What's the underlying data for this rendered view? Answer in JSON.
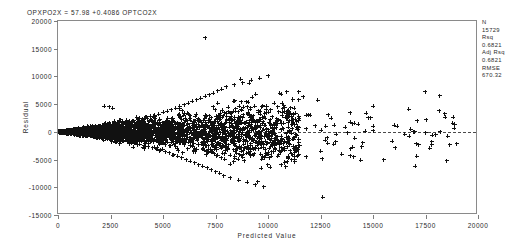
{
  "title": "OPXPO2X = 57.98 +0.4086 OPTCO2X",
  "axes": {
    "x_title": "Predicted Value",
    "y_title": "Residual"
  },
  "stats": {
    "n_label": "N",
    "n_value": "15729",
    "rsq_label": "Rsq",
    "rsq_value": "0.6821",
    "adj_rsq_label": "Adj Rsq",
    "adj_rsq_value": "0.6821",
    "rmse_label": "RMSE",
    "rmse_value": "670.32"
  },
  "chart_data": {
    "type": "scatter",
    "title": "OPXPO2X = 57.98 +0.4086 OPTCO2X",
    "xlabel": "Predicted Value",
    "ylabel": "Residual",
    "xlim": [
      0,
      20000
    ],
    "ylim": [
      -15000,
      20000
    ],
    "xticks": [
      0,
      2500,
      5000,
      7500,
      10000,
      12500,
      15000,
      17500,
      20000
    ],
    "yticks": [
      -15000,
      -10000,
      -5000,
      0,
      5000,
      10000,
      15000,
      20000
    ],
    "xtick_labels": [
      "0",
      "2500",
      "5000",
      "7500",
      "10000",
      "12500",
      "15000",
      "17500",
      "20000"
    ],
    "ytick_labels": [
      "-15000",
      "-10000",
      "-5000",
      "0",
      "5000",
      "10000",
      "15000",
      "20000"
    ],
    "grid": false,
    "legend_position": "outside-right",
    "marker": "plus",
    "marker_color": "#111111",
    "reference_lines": [
      {
        "orientation": "horizontal",
        "value": 0,
        "style": "dashed",
        "color": "#4a4a4a"
      }
    ],
    "annotations": [
      {
        "text": "N 15729"
      },
      {
        "text": "Rsq 0.6821"
      },
      {
        "text": "Adj Rsq 0.6821"
      },
      {
        "text": "RMSE 670.32"
      }
    ],
    "series": [
      {
        "name": "residuals",
        "points": [
          [
            60,
            20
          ],
          [
            90,
            -30
          ],
          [
            120,
            40
          ],
          [
            150,
            -50
          ],
          [
            180,
            60
          ],
          [
            210,
            -70
          ],
          [
            240,
            80
          ],
          [
            270,
            -90
          ],
          [
            300,
            100
          ],
          [
            330,
            -110
          ],
          [
            360,
            120
          ],
          [
            390,
            -130
          ],
          [
            420,
            140
          ],
          [
            450,
            -150
          ],
          [
            480,
            160
          ],
          [
            510,
            -170
          ],
          [
            540,
            180
          ],
          [
            570,
            -190
          ],
          [
            600,
            200
          ],
          [
            630,
            -210
          ],
          [
            660,
            220
          ],
          [
            690,
            -230
          ],
          [
            720,
            240
          ],
          [
            750,
            -250
          ],
          [
            780,
            260
          ],
          [
            810,
            -270
          ],
          [
            840,
            280
          ],
          [
            870,
            -290
          ],
          [
            900,
            300
          ],
          [
            930,
            -310
          ],
          [
            960,
            320
          ],
          [
            990,
            -330
          ],
          [
            1020,
            340
          ],
          [
            1050,
            -350
          ],
          [
            1080,
            360
          ],
          [
            1110,
            -380
          ],
          [
            1140,
            400
          ],
          [
            1170,
            -420
          ],
          [
            1200,
            440
          ],
          [
            1230,
            -460
          ],
          [
            1260,
            480
          ],
          [
            1290,
            -500
          ],
          [
            1320,
            520
          ],
          [
            1350,
            -540
          ],
          [
            1380,
            560
          ],
          [
            1410,
            -580
          ],
          [
            1440,
            600
          ],
          [
            1470,
            -620
          ],
          [
            1500,
            640
          ],
          [
            1530,
            -660
          ],
          [
            1560,
            680
          ],
          [
            1590,
            -700
          ],
          [
            1620,
            720
          ],
          [
            1650,
            -740
          ],
          [
            1680,
            760
          ],
          [
            1710,
            -780
          ],
          [
            1740,
            800
          ],
          [
            1770,
            -820
          ],
          [
            1800,
            840
          ],
          [
            1830,
            -860
          ],
          [
            1860,
            880
          ],
          [
            1890,
            -900
          ],
          [
            1920,
            920
          ],
          [
            1950,
            -940
          ],
          [
            1980,
            960
          ],
          [
            2010,
            -980
          ],
          [
            2040,
            1000
          ],
          [
            2070,
            -1020
          ],
          [
            2100,
            1040
          ],
          [
            2130,
            -1060
          ],
          [
            2160,
            1080
          ],
          [
            2190,
            -1100
          ],
          [
            2220,
            1120
          ],
          [
            2250,
            -1140
          ],
          [
            2280,
            1160
          ],
          [
            2310,
            -1180
          ],
          [
            2340,
            1200
          ],
          [
            2370,
            -1220
          ],
          [
            2400,
            1240
          ],
          [
            2430,
            -1260
          ],
          [
            2460,
            1280
          ],
          [
            2490,
            -1300
          ],
          [
            2520,
            1320
          ],
          [
            2550,
            -1340
          ],
          [
            2580,
            1360
          ],
          [
            2610,
            -1380
          ],
          [
            2640,
            1400
          ],
          [
            2670,
            -1420
          ],
          [
            2700,
            1440
          ],
          [
            2730,
            -1460
          ],
          [
            2760,
            1480
          ],
          [
            2790,
            -1500
          ],
          [
            2820,
            1520
          ],
          [
            2850,
            -1540
          ],
          [
            2880,
            1560
          ],
          [
            2910,
            -1580
          ],
          [
            2940,
            1600
          ],
          [
            2970,
            -1620
          ],
          [
            3000,
            1650
          ],
          [
            3100,
            -1700
          ],
          [
            3200,
            1750
          ],
          [
            3300,
            -1800
          ],
          [
            3400,
            1900
          ],
          [
            3500,
            -1950
          ],
          [
            3600,
            2000
          ],
          [
            3700,
            -2100
          ],
          [
            3800,
            2200
          ],
          [
            3900,
            -2250
          ],
          [
            4000,
            2400
          ],
          [
            4100,
            -2450
          ],
          [
            4200,
            2600
          ],
          [
            4300,
            -2700
          ],
          [
            4400,
            2800
          ],
          [
            4500,
            -2900
          ],
          [
            4600,
            3000
          ],
          [
            4700,
            -3100
          ],
          [
            4800,
            3200
          ],
          [
            4900,
            -3300
          ],
          [
            5000,
            3500
          ],
          [
            5100,
            -3600
          ],
          [
            5200,
            3700
          ],
          [
            5300,
            -3800
          ],
          [
            5400,
            4000
          ],
          [
            5500,
            -4100
          ],
          [
            5600,
            4300
          ],
          [
            5700,
            -4400
          ],
          [
            5800,
            4600
          ],
          [
            5900,
            -4700
          ],
          [
            6000,
            4900
          ],
          [
            6100,
            -5000
          ],
          [
            6200,
            5200
          ],
          [
            6300,
            -5300
          ],
          [
            6400,
            5500
          ],
          [
            6500,
            -5600
          ],
          [
            6600,
            5800
          ],
          [
            6700,
            -5900
          ],
          [
            6800,
            6100
          ],
          [
            6900,
            -6200
          ],
          [
            7000,
            6400
          ],
          [
            7100,
            -6500
          ],
          [
            7200,
            6700
          ],
          [
            7300,
            -6800
          ],
          [
            7400,
            7000
          ],
          [
            7500,
            -7200
          ],
          [
            7600,
            7400
          ],
          [
            7700,
            -7500
          ],
          [
            7800,
            7700
          ],
          [
            7900,
            -7900
          ],
          [
            8000,
            8100
          ],
          [
            8200,
            -8300
          ],
          [
            8400,
            8500
          ],
          [
            8600,
            -8700
          ],
          [
            8800,
            8900
          ],
          [
            9000,
            -9100
          ],
          [
            9200,
            9300
          ],
          [
            9400,
            -9500
          ],
          [
            9600,
            9700
          ],
          [
            9800,
            -9900
          ],
          [
            10000,
            10100
          ],
          [
            7000,
            17000
          ],
          [
            2200,
            4600
          ],
          [
            2450,
            4500
          ],
          [
            2600,
            4300
          ],
          [
            11000,
            2000
          ],
          [
            11500,
            -2500
          ],
          [
            12000,
            3000
          ],
          [
            12500,
            -3500
          ],
          [
            13000,
            2500
          ],
          [
            13500,
            -4000
          ],
          [
            14000,
            1500
          ],
          [
            14500,
            -2000
          ],
          [
            15000,
            1000
          ],
          [
            15500,
            -5000
          ],
          [
            16000,
            1200
          ],
          [
            17000,
            -6200
          ],
          [
            18500,
            -5200
          ],
          [
            12600,
            -11800
          ],
          [
            9500,
            -9000
          ],
          [
            8700,
            9500
          ],
          [
            9100,
            8800
          ],
          [
            10300,
            5200
          ],
          [
            10800,
            -5500
          ]
        ]
      }
    ]
  }
}
